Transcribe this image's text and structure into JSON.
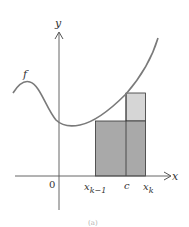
{
  "diagram": {
    "type": "riemann-sum-rectangle",
    "function_label": "f",
    "axes": {
      "x_label": "x",
      "y_label": "y",
      "origin_label": "0"
    },
    "ticks": [
      {
        "main": "x",
        "sub": "k−1"
      },
      {
        "main": "c",
        "sub": ""
      },
      {
        "main": "x",
        "sub": "k"
      }
    ],
    "caption": "(a)",
    "colors": {
      "curve": "#7a7a7a",
      "axis": "#555555",
      "rect_dark": "#a9a9a9",
      "rect_light": "#d6d6d6",
      "rect_stroke": "#333333"
    }
  }
}
